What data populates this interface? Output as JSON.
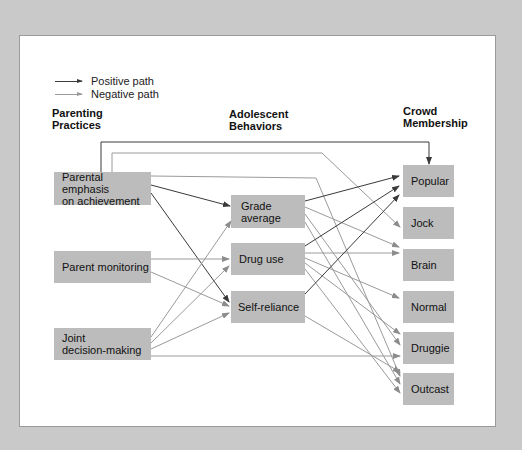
{
  "legend": {
    "positive_label": "Positive path",
    "negative_label": "Negative path",
    "positive_color": "#3a3a3a",
    "negative_color": "#9a9a9a"
  },
  "columns": {
    "parenting": "Parenting\nPractices",
    "adolescent": "Adolescent\nBehaviors",
    "crowd": "Crowd\nMembership"
  },
  "nodes": {
    "parenting": [
      {
        "id": "emphasis",
        "label": "Parental emphasis\non achievement"
      },
      {
        "id": "monitoring",
        "label": "Parent monitoring"
      },
      {
        "id": "joint",
        "label": "Joint\ndecision-making"
      }
    ],
    "behaviors": [
      {
        "id": "grade",
        "label": "Grade\naverage"
      },
      {
        "id": "drug",
        "label": "Drug use"
      },
      {
        "id": "self",
        "label": "Self-reliance"
      }
    ],
    "crowds": [
      {
        "id": "popular",
        "label": "Popular"
      },
      {
        "id": "jock",
        "label": "Jock"
      },
      {
        "id": "brain",
        "label": "Brain"
      },
      {
        "id": "normal",
        "label": "Normal"
      },
      {
        "id": "druggie",
        "label": "Druggie"
      },
      {
        "id": "outcast",
        "label": "Outcast"
      }
    ]
  },
  "paths": [
    {
      "from": "emphasis",
      "to": "popular",
      "type": "positive"
    },
    {
      "from": "emphasis",
      "to": "jock",
      "type": "negative"
    },
    {
      "from": "emphasis",
      "to": "outcast",
      "type": "negative"
    },
    {
      "from": "emphasis",
      "to": "grade",
      "type": "positive"
    },
    {
      "from": "emphasis",
      "to": "self",
      "type": "positive"
    },
    {
      "from": "monitoring",
      "to": "drug",
      "type": "negative"
    },
    {
      "from": "monitoring",
      "to": "self",
      "type": "negative"
    },
    {
      "from": "joint",
      "to": "grade",
      "type": "negative"
    },
    {
      "from": "joint",
      "to": "drug",
      "type": "negative"
    },
    {
      "from": "joint",
      "to": "self",
      "type": "negative"
    },
    {
      "from": "joint",
      "to": "druggie",
      "type": "negative"
    },
    {
      "from": "grade",
      "to": "popular",
      "type": "positive"
    },
    {
      "from": "grade",
      "to": "brain",
      "type": "negative"
    },
    {
      "from": "grade",
      "to": "druggie",
      "type": "negative"
    },
    {
      "from": "grade",
      "to": "outcast",
      "type": "negative"
    },
    {
      "from": "drug",
      "to": "popular",
      "type": "positive"
    },
    {
      "from": "drug",
      "to": "brain",
      "type": "negative"
    },
    {
      "from": "drug",
      "to": "normal",
      "type": "negative"
    },
    {
      "from": "drug",
      "to": "druggie",
      "type": "negative"
    },
    {
      "from": "drug",
      "to": "outcast",
      "type": "negative"
    },
    {
      "from": "self",
      "to": "popular",
      "type": "positive"
    },
    {
      "from": "self",
      "to": "outcast",
      "type": "negative"
    }
  ]
}
